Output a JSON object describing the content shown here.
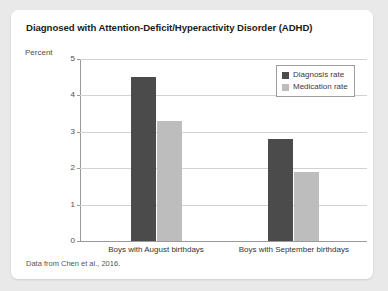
{
  "card": {
    "title": "Diagnosed with Attention-Deficit/Hyperactivity Disorder (ADHD)",
    "source_note": "Data from Chen et al., 2016."
  },
  "chart_data": {
    "type": "bar",
    "title": "Diagnosed with Attention-Deficit/Hyperactivity Disorder (ADHD)",
    "xlabel": "",
    "ylabel": "Percent",
    "ylim": [
      0,
      5
    ],
    "yticks": [
      0,
      1,
      2,
      3,
      4,
      5
    ],
    "ytick_labels": [
      "0",
      "1",
      "2",
      "3",
      "4",
      "5"
    ],
    "grid": true,
    "legend_position": "top-right",
    "categories": [
      "Boys with August birthdays",
      "Boys with September birthdays"
    ],
    "series": [
      {
        "name": "Diagnosis rate",
        "color": "#4b4b4b",
        "values": [
          4.5,
          2.8
        ]
      },
      {
        "name": "Medication rate",
        "color": "#bdbdbd",
        "values": [
          3.3,
          1.9
        ]
      }
    ],
    "source": "Data from Chen et al., 2016."
  },
  "colors": {
    "page_background": "#e9e9e9",
    "card_background": "#ffffff",
    "diagnosis": "#4b4b4b",
    "medication": "#bdbdbd",
    "gridline": "#d2d2d2",
    "axis": "#9a9a9a"
  }
}
